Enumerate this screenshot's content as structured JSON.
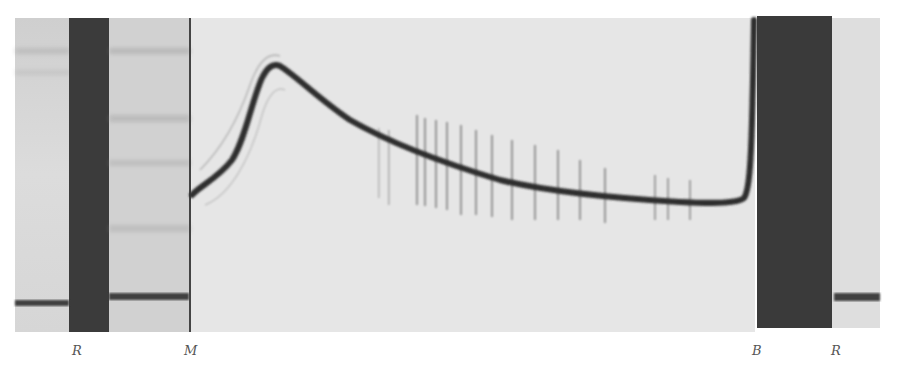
{
  "figure": {
    "colors": {
      "background": "#ffffff",
      "plate_light": "#e4e4e4",
      "panel_left": "#d2d2d2",
      "bar_dark": "#3a3a3a",
      "trace": "#333333"
    },
    "labels": [
      {
        "id": "R_left",
        "text": "R",
        "x": 72
      },
      {
        "id": "M",
        "text": "M",
        "x": 184
      },
      {
        "id": "B",
        "text": "B",
        "x": 752
      },
      {
        "id": "R_right",
        "text": "R",
        "x": 831
      }
    ],
    "trace_points": [
      [
        192,
        195
      ],
      [
        205,
        183
      ],
      [
        225,
        165
      ],
      [
        242,
        140
      ],
      [
        255,
        100
      ],
      [
        266,
        74
      ],
      [
        275,
        66
      ],
      [
        290,
        75
      ],
      [
        310,
        95
      ],
      [
        340,
        117
      ],
      [
        380,
        138
      ],
      [
        420,
        155
      ],
      [
        460,
        168
      ],
      [
        500,
        180
      ],
      [
        540,
        188
      ],
      [
        580,
        194
      ],
      [
        620,
        198
      ],
      [
        680,
        202
      ],
      [
        730,
        203
      ],
      [
        742,
        199
      ],
      [
        749,
        185
      ],
      [
        752,
        150
      ],
      [
        754,
        20
      ]
    ],
    "fringe_x": [
      417,
      425,
      436,
      447,
      461,
      476,
      492,
      512,
      535,
      558,
      580,
      605,
      655,
      668,
      690
    ]
  }
}
